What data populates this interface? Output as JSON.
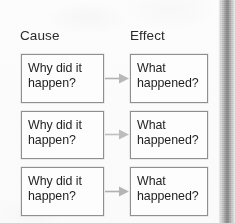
{
  "diagram": {
    "type": "cause-and-effect",
    "columns": [
      {
        "key": "cause",
        "label": "Cause"
      },
      {
        "key": "effect",
        "label": "Effect"
      }
    ],
    "rows": [
      {
        "cause": "Why did it\nhappen?",
        "effect": "What\nhappened?",
        "connector": "arrow-right"
      },
      {
        "cause": "Why did it\nhappen?",
        "effect": "What\nhappened?",
        "connector": "arrow-right"
      },
      {
        "cause": "Why did it\nhappen?",
        "effect": "What\nhappened?",
        "connector": "arrow-right"
      }
    ],
    "colors": {
      "page_background": "#fbfbfb",
      "box_fill": "#fdfdfd",
      "box_border": "#8f8f8f",
      "text": "#1f1f1f",
      "label_text": "#2b2b2b",
      "arrow": "#b2b2b2",
      "gutter_band": "#8e8e8e"
    }
  }
}
